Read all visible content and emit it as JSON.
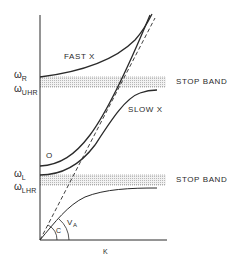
{
  "figure": {
    "type": "dispersion-diagram",
    "x_axis_label": "K",
    "y_axis_levels": [
      {
        "symbol": "ω",
        "subscript": "R"
      },
      {
        "symbol": "ω",
        "subscript": "UHR"
      },
      {
        "symbol": "ω",
        "subscript": "L"
      },
      {
        "symbol": "ω",
        "subscript": "LHR"
      }
    ],
    "bands": [
      {
        "label": "STOP BAND",
        "between": [
          "ωR",
          "ωUHR"
        ]
      },
      {
        "label": "STOP BAND",
        "between": [
          "ωL",
          "ωLHR"
        ]
      }
    ],
    "curve_labels": {
      "fast_x": "FAST X",
      "slow_x": "SLOW X",
      "o_mode": "O"
    },
    "angle_labels": {
      "c": "C",
      "va": "V",
      "va_sub": "A"
    },
    "colors": {
      "ink": "#2a2a2a",
      "band_fill": "#e4e4e4"
    }
  }
}
